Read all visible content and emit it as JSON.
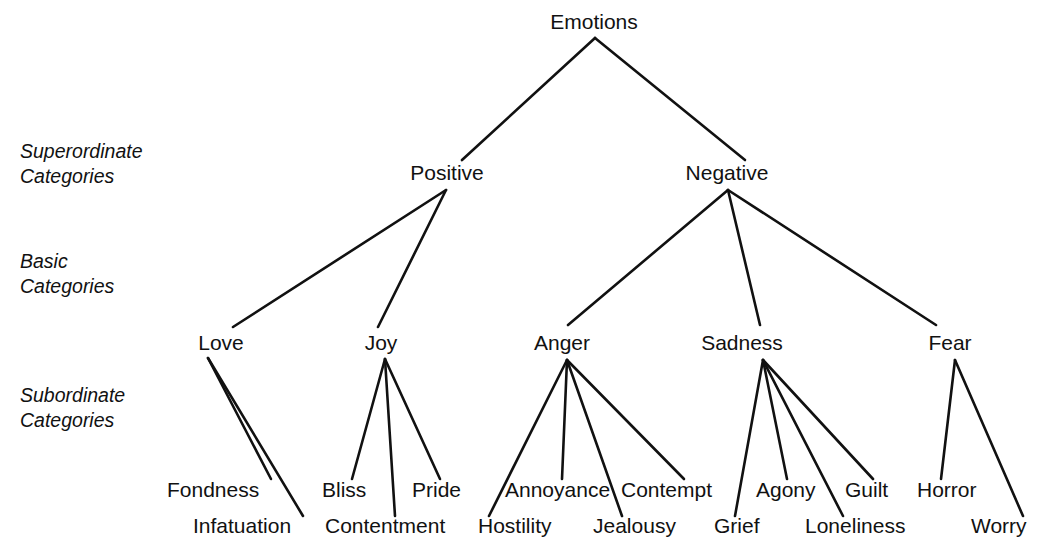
{
  "diagram": {
    "title": "Emotions",
    "level_labels": [
      {
        "id": "superordinate",
        "line1": "Superordinate",
        "line2": "Categories",
        "x": 20,
        "y1": 158,
        "y2": 183
      },
      {
        "id": "basic",
        "line1": "Basic",
        "line2": "Categories",
        "x": 20,
        "y1": 268,
        "y2": 293
      },
      {
        "id": "subordinate",
        "line1": "Subordinate",
        "line2": "Categories",
        "x": 20,
        "y1": 402,
        "y2": 427
      }
    ],
    "nodes": [
      {
        "id": "emotions",
        "label": "Emotions",
        "level": "root",
        "x": 594,
        "y": 29,
        "anchor": "middle"
      },
      {
        "id": "positive",
        "label": "Positive",
        "level": "superordinate",
        "x": 447,
        "y": 180,
        "anchor": "middle"
      },
      {
        "id": "negative",
        "label": "Negative",
        "level": "superordinate",
        "x": 727,
        "y": 180,
        "anchor": "middle"
      },
      {
        "id": "love",
        "label": "Love",
        "level": "basic",
        "x": 221,
        "y": 350,
        "anchor": "middle"
      },
      {
        "id": "joy",
        "label": "Joy",
        "level": "basic",
        "x": 381,
        "y": 350,
        "anchor": "middle"
      },
      {
        "id": "anger",
        "label": "Anger",
        "level": "basic",
        "x": 562,
        "y": 350,
        "anchor": "middle"
      },
      {
        "id": "sadness",
        "label": "Sadness",
        "level": "basic",
        "x": 742,
        "y": 350,
        "anchor": "middle"
      },
      {
        "id": "fear",
        "label": "Fear",
        "level": "basic",
        "x": 950,
        "y": 350,
        "anchor": "middle"
      },
      {
        "id": "fondness",
        "label": "Fondness",
        "level": "subordinate",
        "x": 167,
        "y": 497,
        "anchor": "start"
      },
      {
        "id": "infatuation",
        "label": "Infatuation",
        "level": "subordinate",
        "x": 193,
        "y": 533,
        "anchor": "start"
      },
      {
        "id": "bliss",
        "label": "Bliss",
        "level": "subordinate",
        "x": 322,
        "y": 497,
        "anchor": "start"
      },
      {
        "id": "contentment",
        "label": "Contentment",
        "level": "subordinate",
        "x": 325,
        "y": 533,
        "anchor": "start"
      },
      {
        "id": "pride",
        "label": "Pride",
        "level": "subordinate",
        "x": 412,
        "y": 497,
        "anchor": "start"
      },
      {
        "id": "annoyance",
        "label": "Annoyance",
        "level": "subordinate",
        "x": 505,
        "y": 497,
        "anchor": "start"
      },
      {
        "id": "hostility",
        "label": "Hostility",
        "level": "subordinate",
        "x": 478,
        "y": 533,
        "anchor": "start"
      },
      {
        "id": "contempt",
        "label": "Contempt",
        "level": "subordinate",
        "x": 621,
        "y": 497,
        "anchor": "start"
      },
      {
        "id": "jealousy",
        "label": "Jealousy",
        "level": "subordinate",
        "x": 593,
        "y": 533,
        "anchor": "start"
      },
      {
        "id": "agony",
        "label": "Agony",
        "level": "subordinate",
        "x": 756,
        "y": 497,
        "anchor": "start"
      },
      {
        "id": "grief",
        "label": "Grief",
        "level": "subordinate",
        "x": 714,
        "y": 533,
        "anchor": "start"
      },
      {
        "id": "guilt",
        "label": "Guilt",
        "level": "subordinate",
        "x": 845,
        "y": 497,
        "anchor": "start"
      },
      {
        "id": "loneliness",
        "label": "Loneliness",
        "level": "subordinate",
        "x": 805,
        "y": 533,
        "anchor": "start"
      },
      {
        "id": "horror",
        "label": "Horror",
        "level": "subordinate",
        "x": 917,
        "y": 497,
        "anchor": "start"
      },
      {
        "id": "worry",
        "label": "Worry",
        "level": "subordinate",
        "x": 971,
        "y": 533,
        "anchor": "start"
      }
    ],
    "edges": [
      {
        "id": "emotions-positive",
        "from": "emotions",
        "to": "positive",
        "x1": 595,
        "y1": 38,
        "x2": 462,
        "y2": 160
      },
      {
        "id": "emotions-negative",
        "from": "emotions",
        "to": "negative",
        "x1": 595,
        "y1": 38,
        "x2": 745,
        "y2": 160
      },
      {
        "id": "positive-love",
        "from": "positive",
        "to": "love",
        "x1": 446,
        "y1": 190,
        "x2": 233,
        "y2": 327
      },
      {
        "id": "positive-joy",
        "from": "positive",
        "to": "joy",
        "x1": 446,
        "y1": 190,
        "x2": 378,
        "y2": 327
      },
      {
        "id": "negative-anger",
        "from": "negative",
        "to": "anger",
        "x1": 728,
        "y1": 190,
        "x2": 568,
        "y2": 325
      },
      {
        "id": "negative-sadness",
        "from": "negative",
        "to": "sadness",
        "x1": 728,
        "y1": 190,
        "x2": 760,
        "y2": 325
      },
      {
        "id": "negative-fear",
        "from": "negative",
        "to": "fear",
        "x1": 728,
        "y1": 190,
        "x2": 936,
        "y2": 325
      },
      {
        "id": "love-fondness",
        "from": "love",
        "to": "fondness",
        "x1": 208,
        "y1": 358,
        "x2": 271,
        "y2": 479
      },
      {
        "id": "love-infatuation",
        "from": "love",
        "to": "infatuation",
        "x1": 208,
        "y1": 358,
        "x2": 303,
        "y2": 516
      },
      {
        "id": "joy-bliss",
        "from": "joy",
        "to": "bliss",
        "x1": 385,
        "y1": 359,
        "x2": 352,
        "y2": 479
      },
      {
        "id": "joy-contentment",
        "from": "joy",
        "to": "contentment",
        "x1": 385,
        "y1": 359,
        "x2": 395,
        "y2": 516
      },
      {
        "id": "joy-pride",
        "from": "joy",
        "to": "pride",
        "x1": 385,
        "y1": 359,
        "x2": 440,
        "y2": 479
      },
      {
        "id": "anger-hostility",
        "from": "anger",
        "to": "hostility",
        "x1": 567,
        "y1": 360,
        "x2": 489,
        "y2": 516
      },
      {
        "id": "anger-annoyance",
        "from": "anger",
        "to": "annoyance",
        "x1": 567,
        "y1": 360,
        "x2": 562,
        "y2": 479
      },
      {
        "id": "anger-jealousy",
        "from": "anger",
        "to": "jealousy",
        "x1": 567,
        "y1": 360,
        "x2": 622,
        "y2": 516
      },
      {
        "id": "anger-contempt",
        "from": "anger",
        "to": "contempt",
        "x1": 567,
        "y1": 360,
        "x2": 684,
        "y2": 479
      },
      {
        "id": "sadness-grief",
        "from": "sadness",
        "to": "grief",
        "x1": 763,
        "y1": 360,
        "x2": 735,
        "y2": 516
      },
      {
        "id": "sadness-agony",
        "from": "sadness",
        "to": "agony",
        "x1": 763,
        "y1": 360,
        "x2": 787,
        "y2": 479
      },
      {
        "id": "sadness-loneliness",
        "from": "sadness",
        "to": "loneliness",
        "x1": 763,
        "y1": 360,
        "x2": 843,
        "y2": 516
      },
      {
        "id": "sadness-guilt",
        "from": "sadness",
        "to": "guilt",
        "x1": 763,
        "y1": 360,
        "x2": 873,
        "y2": 479
      },
      {
        "id": "fear-horror",
        "from": "fear",
        "to": "horror",
        "x1": 955,
        "y1": 360,
        "x2": 941,
        "y2": 479
      },
      {
        "id": "fear-worry",
        "from": "fear",
        "to": "worry",
        "x1": 955,
        "y1": 360,
        "x2": 1023,
        "y2": 516
      }
    ]
  }
}
